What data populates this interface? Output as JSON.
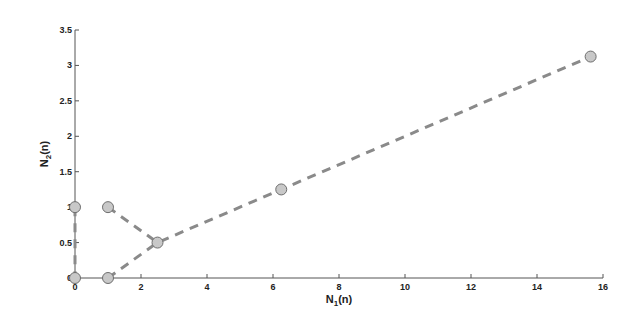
{
  "chart_data": {
    "type": "scatter",
    "title": "",
    "xlabel": "N_1(n)",
    "ylabel": "N_2(n)",
    "xlim": [
      0,
      16
    ],
    "ylim": [
      0,
      3.5
    ],
    "xticks": [
      0,
      2,
      4,
      6,
      8,
      10,
      12,
      14,
      16
    ],
    "yticks": [
      0,
      0.5,
      1,
      1.5,
      2,
      2.5,
      3,
      3.5
    ],
    "xtick_labels": [
      "0",
      "2",
      "4",
      "6",
      "8",
      "10",
      "12",
      "14",
      "16"
    ],
    "ytick_labels": [
      "0",
      "0.5",
      "1",
      "1.5",
      "2",
      "2.5",
      "3",
      "3.5"
    ],
    "grid": false,
    "legend": null,
    "series": [
      {
        "name": "trajectory-a",
        "line_style": "dashed",
        "points": [
          [
            0,
            1
          ],
          [
            0,
            0
          ]
        ]
      },
      {
        "name": "trajectory-b",
        "line_style": "dashed",
        "points": [
          [
            1,
            0
          ],
          [
            2.5,
            0.5
          ],
          [
            6.25,
            1.25
          ],
          [
            15.625,
            3.125
          ]
        ]
      },
      {
        "name": "trajectory-c",
        "line_style": "dashed",
        "points": [
          [
            1,
            1
          ],
          [
            2.5,
            0.5
          ]
        ]
      }
    ],
    "colors": {
      "line": "#8a8a8a",
      "marker_fill": "#c8c8c8",
      "marker_stroke": "#6e6e6e",
      "axis": "#555555"
    }
  }
}
